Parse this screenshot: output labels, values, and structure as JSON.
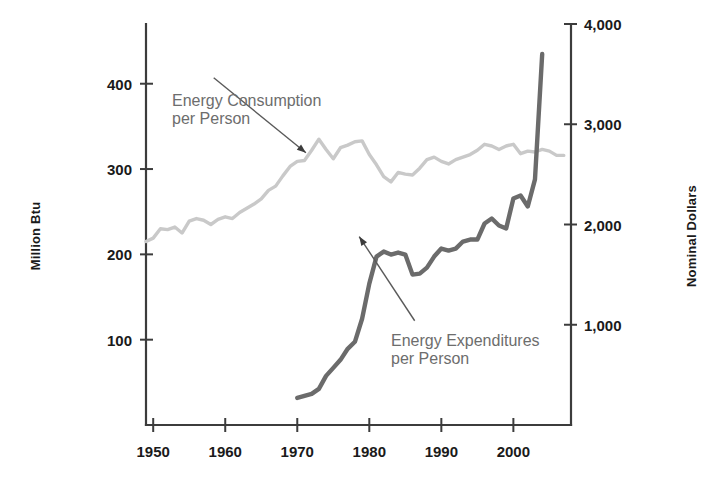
{
  "chart_data": {
    "type": "line",
    "title": "",
    "subtitle": "",
    "xlabel": "",
    "ylabel": "Million Btu",
    "ylabel_right": "Nominal Dollars",
    "grid": false,
    "legend_position": "inline-annotations",
    "xlim": [
      1949,
      2008
    ],
    "ylim": [
      0,
      470
    ],
    "ylim_right": [
      0,
      4000
    ],
    "xticks": [
      1950,
      1960,
      1970,
      1980,
      1990,
      2000
    ],
    "xtick_labels": [
      "1950",
      "1960",
      "1970",
      "1980",
      "1990",
      "2000"
    ],
    "yticks": [
      100,
      200,
      300,
      400
    ],
    "ytick_labels": [
      "100",
      "200",
      "300",
      "400"
    ],
    "yticks_right": [
      1000,
      2000,
      3000,
      4000
    ],
    "ytick_labels_right": [
      "1,000",
      "2,000",
      "3,000",
      "4,000"
    ],
    "series": [
      {
        "name": "Energy Consumption per Person",
        "axis": "left",
        "unit": "Million Btu",
        "color": "#c9c9c9",
        "x": [
          1949,
          1950,
          1951,
          1952,
          1953,
          1954,
          1955,
          1956,
          1957,
          1958,
          1959,
          1960,
          1961,
          1962,
          1963,
          1964,
          1965,
          1966,
          1967,
          1968,
          1969,
          1970,
          1971,
          1972,
          1973,
          1974,
          1975,
          1976,
          1977,
          1978,
          1979,
          1980,
          1981,
          1982,
          1983,
          1984,
          1985,
          1986,
          1987,
          1988,
          1989,
          1990,
          1991,
          1992,
          1993,
          1994,
          1995,
          1996,
          1997,
          1998,
          1999,
          2000,
          2001,
          2002,
          2003,
          2004,
          2005,
          2006,
          2007
        ],
        "values": [
          215,
          219,
          230,
          229,
          232,
          225,
          239,
          242,
          240,
          235,
          241,
          244,
          242,
          249,
          254,
          259,
          265,
          275,
          280,
          292,
          303,
          309,
          310,
          322,
          335,
          323,
          312,
          325,
          328,
          332,
          333,
          317,
          305,
          291,
          285,
          296,
          294,
          293,
          301,
          311,
          314,
          309,
          306,
          311,
          314,
          317,
          322,
          329,
          327,
          323,
          327,
          329,
          318,
          321,
          320,
          323,
          321,
          316,
          316
        ]
      },
      {
        "name": "Energy Expenditures per Person",
        "axis": "right",
        "unit": "Nominal Dollars",
        "color": "#6b6b6b",
        "x": [
          1970,
          1971,
          1972,
          1973,
          1974,
          1975,
          1976,
          1977,
          1978,
          1979,
          1980,
          1981,
          1982,
          1983,
          1984,
          1985,
          1986,
          1987,
          1988,
          1989,
          1990,
          1991,
          1992,
          1993,
          1994,
          1995,
          1996,
          1997,
          1998,
          1999,
          2000,
          2001,
          2002,
          2003,
          2004
        ],
        "values": [
          270,
          290,
          310,
          360,
          490,
          570,
          650,
          760,
          830,
          1060,
          1410,
          1680,
          1730,
          1700,
          1720,
          1700,
          1500,
          1510,
          1570,
          1680,
          1760,
          1740,
          1760,
          1830,
          1850,
          1850,
          2010,
          2060,
          1990,
          1960,
          2260,
          2290,
          2180,
          2450,
          3700
        ]
      }
    ],
    "annotations": [
      {
        "id": "consumption",
        "text": "Energy Consumption\nper Person",
        "arrow_from": [
          1958.4,
          407
        ],
        "arrow_to": [
          1971.2,
          319
        ]
      },
      {
        "id": "expenditures",
        "text": "Energy Expenditures\nper Person",
        "arrow_from": [
          1986.3,
          1040
        ],
        "arrow_to": [
          1978.6,
          1880
        ]
      }
    ]
  },
  "axes": {
    "left_title": "Million Btu",
    "right_title": "Nominal Dollars"
  },
  "colors": {
    "consumption_line": "#c9c9c9",
    "expenditures_line": "#6b6b6b",
    "axis": "#3c3c3c",
    "text": "#1a1a1a",
    "annotation_text": "#6d6d6d",
    "background": "#ffffff"
  }
}
